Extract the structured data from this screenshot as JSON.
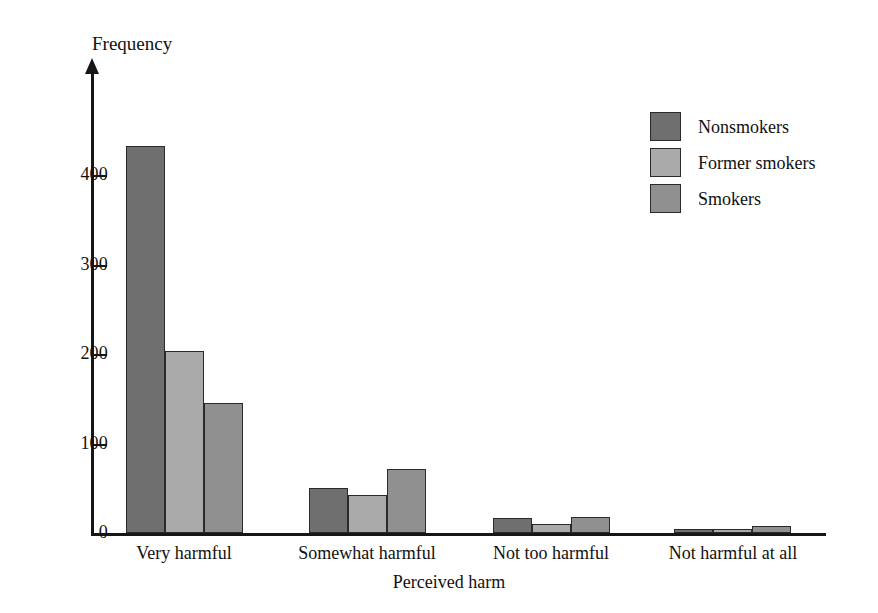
{
  "chart_data": {
    "type": "bar",
    "title": "",
    "xlabel": "Perceived harm",
    "ylabel": "Frequency",
    "categories": [
      "Very harmful",
      "Somewhat harmful",
      "Not too harmful",
      "Not harmful at all"
    ],
    "series": [
      {
        "name": "Nonsmokers",
        "color": "#6f6f6f",
        "values": [
          432,
          50,
          17,
          5
        ]
      },
      {
        "name": "Former smokers",
        "color": "#aaaaaa",
        "values": [
          203,
          42,
          10,
          4
        ]
      },
      {
        "name": "Smokers",
        "color": "#909090",
        "values": [
          145,
          71,
          18,
          8
        ]
      }
    ],
    "ylim": [
      0,
      460
    ],
    "yticks": [
      0,
      100,
      200,
      300,
      400
    ],
    "ytick_labels": [
      "0",
      "100",
      "200",
      "300",
      "400"
    ],
    "grid": false,
    "legend_position": "top-right",
    "legend_entries": [
      "Nonsmokers",
      "Former smokers",
      "Smokers"
    ],
    "axis_color": "#161616",
    "background_color": "#ffffff"
  },
  "geometry": {
    "baseline_y": 533,
    "unit_px_per_value": 0.895,
    "group_left_x": [
      126,
      309,
      493,
      674
    ],
    "bar_width": 39,
    "category_center_x": [
      184,
      367,
      551,
      733
    ]
  }
}
